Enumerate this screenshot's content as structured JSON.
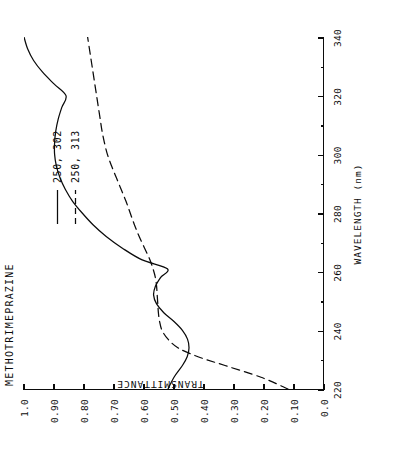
{
  "chart_data": {
    "type": "line",
    "title": "METHOTRIMEPRAZINE",
    "xlabel": "WAVELENGTH (nm)",
    "ylabel": "TRANSMITTANCE",
    "xlim": [
      220,
      340
    ],
    "ylim": [
      0.0,
      1.0
    ],
    "grid": false,
    "legend_position": "upper right",
    "xticks": [
      220,
      240,
      260,
      280,
      300,
      320,
      340
    ],
    "xticklabels": [
      "220",
      "240",
      "260",
      "280",
      "300",
      "320",
      "340"
    ],
    "yticks": [
      0.0,
      0.1,
      0.2,
      0.3,
      0.4,
      0.5,
      0.6,
      0.7,
      0.8,
      0.9,
      1.0
    ],
    "yticklabels": [
      "0.0",
      "0.10",
      "0.20",
      "0.30",
      "0.40",
      "0.50",
      "0.60",
      "0.70",
      "0.80",
      "0.90",
      "1.0"
    ],
    "series": [
      {
        "name": "250, 302",
        "style": "solid",
        "color": "#0b0b0b",
        "x": [
          220,
          224,
          228,
          231,
          234,
          237,
          240,
          243,
          246,
          249,
          252,
          255,
          258,
          261,
          264,
          268,
          272,
          276,
          280,
          284,
          288,
          292,
          296,
          300,
          304,
          308,
          312,
          316,
          320,
          324,
          328,
          332,
          336,
          340
        ],
        "y": [
          0.52,
          0.5,
          0.472,
          0.456,
          0.45,
          0.455,
          0.472,
          0.5,
          0.534,
          0.558,
          0.568,
          0.562,
          0.545,
          0.522,
          0.606,
          0.672,
          0.726,
          0.77,
          0.806,
          0.838,
          0.862,
          0.88,
          0.892,
          0.898,
          0.898,
          0.894,
          0.886,
          0.874,
          0.86,
          0.9,
          0.938,
          0.968,
          0.988,
          1.0
        ]
      },
      {
        "name": "250, 313",
        "style": "dashed",
        "color": "#0b0b0b",
        "x": [
          220,
          224,
          228,
          231,
          234,
          237,
          240,
          243,
          246,
          249,
          252,
          255,
          258,
          261,
          264,
          268,
          272,
          276,
          280,
          284,
          288,
          292,
          296,
          300,
          304,
          308,
          312,
          316,
          320,
          324,
          328,
          332,
          336,
          340
        ],
        "y": [
          0.12,
          0.21,
          0.33,
          0.42,
          0.486,
          0.52,
          0.54,
          0.548,
          0.552,
          0.554,
          0.556,
          0.558,
          0.562,
          0.57,
          0.58,
          0.598,
          0.616,
          0.632,
          0.646,
          0.66,
          0.676,
          0.692,
          0.708,
          0.722,
          0.732,
          0.74,
          0.746,
          0.752,
          0.758,
          0.764,
          0.77,
          0.776,
          0.782,
          0.788
        ]
      }
    ]
  }
}
